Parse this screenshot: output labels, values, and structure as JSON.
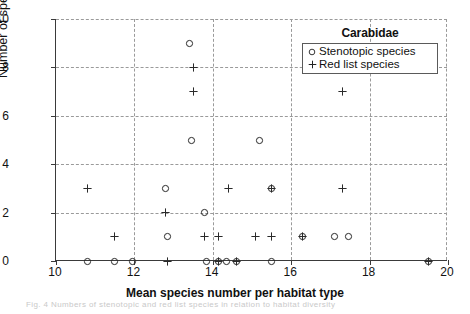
{
  "figure": {
    "caption_remnant": "Fig. 4 Numbers of stenotopic and red list species in relation to habitat diversity"
  },
  "legend": {
    "title": "Carabidae",
    "entries": [
      {
        "symbol": "circle-marker",
        "label": "Stenotopic species"
      },
      {
        "symbol": "plus-marker",
        "label": "Red list species"
      }
    ]
  },
  "chart_data": {
    "type": "scatter",
    "title": "Carabidae",
    "xlabel": "Mean species number per habitat type",
    "ylabel": "Number of species",
    "xlim": [
      10,
      20
    ],
    "ylim": [
      0,
      10
    ],
    "xticks": [
      10,
      12,
      14,
      16,
      18,
      20
    ],
    "yticks": [
      0,
      2,
      4,
      6,
      8,
      10
    ],
    "grid": true,
    "legend_position": "top-right",
    "series": [
      {
        "name": "Stenotopic species",
        "marker": "circle",
        "points": [
          [
            13.4,
            9
          ],
          [
            13.45,
            5
          ],
          [
            15.2,
            5
          ],
          [
            12.8,
            3
          ],
          [
            15.5,
            3
          ],
          [
            13.8,
            2
          ],
          [
            12.85,
            1
          ],
          [
            16.3,
            1
          ],
          [
            17.1,
            1
          ],
          [
            17.45,
            1
          ],
          [
            10.8,
            0
          ],
          [
            11.5,
            0
          ],
          [
            11.95,
            0
          ],
          [
            13.85,
            0
          ],
          [
            14.15,
            0
          ],
          [
            14.35,
            0
          ],
          [
            14.6,
            0
          ],
          [
            15.5,
            0
          ],
          [
            19.5,
            0
          ]
        ]
      },
      {
        "name": "Red list species",
        "marker": "plus",
        "points": [
          [
            13.5,
            8
          ],
          [
            13.5,
            7
          ],
          [
            17.3,
            7
          ],
          [
            10.8,
            3
          ],
          [
            14.4,
            3
          ],
          [
            15.5,
            3
          ],
          [
            17.3,
            3
          ],
          [
            12.8,
            2
          ],
          [
            11.5,
            1
          ],
          [
            13.8,
            1
          ],
          [
            14.15,
            1
          ],
          [
            15.1,
            1
          ],
          [
            15.5,
            1
          ],
          [
            16.3,
            1
          ],
          [
            12.85,
            0
          ],
          [
            14.15,
            0
          ],
          [
            14.6,
            0
          ],
          [
            19.5,
            0
          ]
        ]
      }
    ]
  }
}
